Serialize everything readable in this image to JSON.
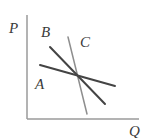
{
  "diagram": {
    "axes": {
      "y_label": "P",
      "x_label": "Q",
      "origin": [
        27,
        119
      ],
      "y_top": 15,
      "x_right": 139,
      "color": "#9a9a9a"
    },
    "lines": [
      {
        "name": "A",
        "label": "A",
        "x1": 40,
        "y1": 65,
        "x2": 115,
        "y2": 86,
        "color": "#444444",
        "width": 2
      },
      {
        "name": "B",
        "label": "B",
        "x1": 50,
        "y1": 47,
        "x2": 105,
        "y2": 104,
        "color": "#444444",
        "width": 2
      },
      {
        "name": "C",
        "label": "C",
        "x1": 68,
        "y1": 37,
        "x2": 87,
        "y2": 114,
        "color": "#8e8e8e",
        "width": 1.5
      }
    ],
    "labels": {
      "P": {
        "text": "P",
        "x": 9,
        "y": 33
      },
      "Q": {
        "text": "Q",
        "x": 129,
        "y": 136
      },
      "A": {
        "text": "A",
        "x": 35,
        "y": 89
      },
      "B": {
        "text": "B",
        "x": 41,
        "y": 37
      },
      "C": {
        "text": "C",
        "x": 80,
        "y": 47
      }
    },
    "intersection": [
      78,
      75
    ]
  }
}
